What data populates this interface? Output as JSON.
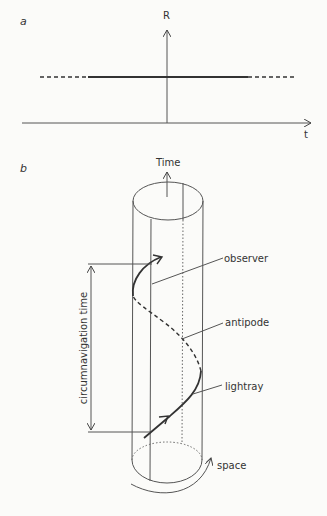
{
  "panel_a": {
    "label": "a",
    "y_axis_label": "R",
    "x_axis_label": "t"
  },
  "panel_b": {
    "label": "b",
    "time_axis_label": "Time",
    "dimension_label": "circumnavigation time",
    "annotations": {
      "observer": "observer",
      "antipode": "antipode",
      "lightray": "lightray",
      "space": "space"
    }
  },
  "colors": {
    "background": "#fbfbf9",
    "ink": "#333333"
  }
}
